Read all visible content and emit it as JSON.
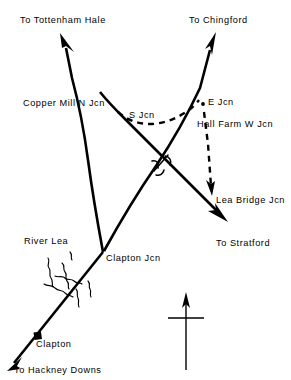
{
  "diagram": {
    "background_color": "#ffffff",
    "line_color": "#000000",
    "labels": {
      "to_tottenham_hale": "To Tottenham Hale",
      "to_chingford": "To Chingford",
      "copper_mill_n_jcn": "Copper Mill N Jcn",
      "s_jcn": "S Jcn",
      "e_jcn": "E Jcn",
      "hall_farm_w_jcn": "Hall Farm W Jcn",
      "lea_bridge_jcn": "Lea Bridge Jcn",
      "to_stratford": "To Stratford",
      "river_lea": "River Lea",
      "clapton_jcn": "Clapton Jcn",
      "clapton": "Clapton",
      "to_hackney_downs": "To Hackney Downs"
    },
    "icons": {
      "north_arrow": "compass-north-arrow",
      "station_marker": "station-dot",
      "bridge_crossing": "bridge-crossing-symbol",
      "river": "river-squiggle"
    }
  }
}
